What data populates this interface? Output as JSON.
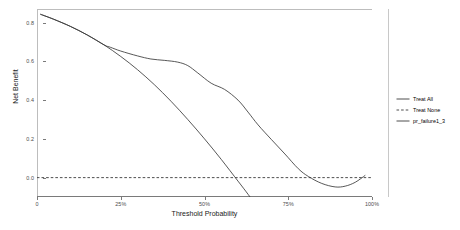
{
  "chart_data": {
    "type": "line",
    "title": "",
    "xlabel": "Threshold Probability",
    "ylabel": "Net Benefit",
    "xlim": [
      0,
      1
    ],
    "ylim": [
      -0.1,
      0.87
    ],
    "grid": false,
    "legend_position": "right",
    "xticks": [
      0,
      0.25,
      0.5,
      0.75,
      1
    ],
    "xticklabels": [
      "0",
      "25%",
      "50%",
      "75%",
      "100%"
    ],
    "yticks": [
      0.0,
      0.2,
      0.4,
      0.6,
      0.8
    ],
    "yticklabels": [
      "0.0",
      "0.2",
      "0.4",
      "0.6",
      "0.8"
    ],
    "series": [
      {
        "name": "Treat All",
        "style": "solid",
        "color": "#3a3a3a",
        "x": [
          0.01,
          0.05,
          0.1,
          0.15,
          0.2,
          0.25,
          0.3,
          0.35,
          0.4,
          0.45,
          0.5,
          0.55,
          0.6,
          0.63,
          0.66,
          0.68,
          0.7
        ],
        "y": [
          0.843,
          0.817,
          0.78,
          0.736,
          0.685,
          0.625,
          0.557,
          0.48,
          0.394,
          0.3,
          0.2,
          0.094,
          -0.018,
          -0.086,
          -0.158,
          -0.207,
          -0.258
        ]
      },
      {
        "name": "Treat None",
        "style": "dashed",
        "color": "#3a3a3a",
        "x": [
          0,
          1
        ],
        "y": [
          0,
          0
        ]
      },
      {
        "name": "pr_failure1_3",
        "style": "solid",
        "color": "#3a3a3a",
        "x": [
          0.01,
          0.05,
          0.1,
          0.15,
          0.2,
          0.22,
          0.25,
          0.3,
          0.34,
          0.38,
          0.42,
          0.45,
          0.48,
          0.52,
          0.56,
          0.6,
          0.63,
          0.66,
          0.7,
          0.74,
          0.78,
          0.81,
          0.85,
          0.89,
          0.92,
          0.95,
          0.98
        ],
        "y": [
          0.843,
          0.817,
          0.78,
          0.736,
          0.685,
          0.672,
          0.653,
          0.628,
          0.612,
          0.605,
          0.596,
          0.578,
          0.54,
          0.487,
          0.455,
          0.4,
          0.338,
          0.272,
          0.196,
          0.122,
          0.046,
          0.006,
          -0.03,
          -0.048,
          -0.044,
          -0.024,
          0.012
        ]
      }
    ]
  },
  "legend": {
    "items": [
      {
        "label": "Treat All",
        "style": "solid"
      },
      {
        "label": "Treat None",
        "style": "dashed"
      },
      {
        "label": "pr_failure1_3",
        "style": "solid"
      }
    ]
  },
  "axes": {
    "x_title": "Threshold Probability",
    "y_title": "Net Benefit"
  }
}
